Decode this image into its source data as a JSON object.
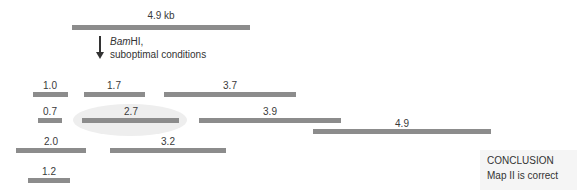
{
  "diagram": {
    "title_fragment": {
      "label": "4.9 kb"
    },
    "treatment": {
      "enzyme": "Bam",
      "enzyme_suffix": "HI,",
      "condition": "suboptimal conditions"
    },
    "fragments": [
      {
        "label": "1.0"
      },
      {
        "label": "1.7"
      },
      {
        "label": "3.7"
      },
      {
        "label": "0.7"
      },
      {
        "label": "2.7"
      },
      {
        "label": "3.9"
      },
      {
        "label": "4.9"
      },
      {
        "label": "2.0"
      },
      {
        "label": "3.2"
      },
      {
        "label": "1.2"
      }
    ],
    "conclusion": {
      "heading": "CONCLUSION",
      "text": "Map II is correct"
    },
    "colors": {
      "bar": "#8c8c8c",
      "highlight": "#eeeeee"
    }
  }
}
